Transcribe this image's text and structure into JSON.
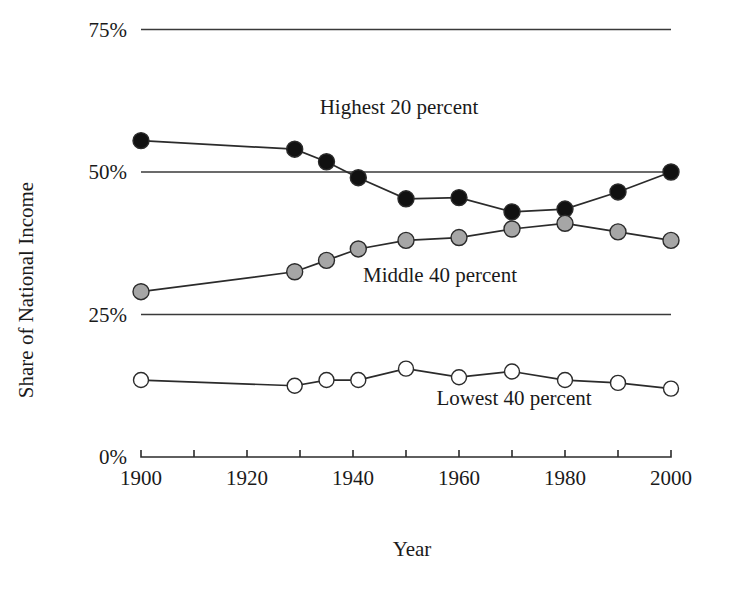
{
  "chart_data": {
    "type": "line",
    "title": "",
    "xlabel": "Year",
    "ylabel": "Share of National Income",
    "xlim": [
      1900,
      2000
    ],
    "ylim": [
      0,
      75
    ],
    "grid": true,
    "legend_position": "inline-annotations",
    "x_tick_labels": [
      "1900",
      "1920",
      "1940",
      "1960",
      "1980",
      "2000"
    ],
    "x_tick_values": [
      1900,
      1920,
      1940,
      1960,
      1980,
      2000
    ],
    "x_minor_tick_values": [
      1910,
      1930,
      1950,
      1970,
      1990
    ],
    "y_tick_labels": [
      "0%",
      "25%",
      "50%",
      "75%"
    ],
    "y_tick_values": [
      0,
      25,
      50,
      75
    ],
    "x": [
      1900,
      1929,
      1935,
      1941,
      1950,
      1960,
      1970,
      1980,
      1990,
      2000
    ],
    "series": [
      {
        "name": "Highest 20 percent",
        "marker": "filled-black-circle",
        "color": "#111111",
        "values": [
          55.5,
          54.0,
          51.8,
          49.0,
          45.3,
          45.5,
          43.0,
          43.5,
          46.5,
          50.0
        ]
      },
      {
        "name": "Middle 40 percent",
        "marker": "filled-gray-circle",
        "color": "#a6a6a6",
        "values": [
          29.0,
          32.5,
          34.5,
          36.5,
          38.0,
          38.5,
          40.0,
          41.0,
          39.5,
          38.0
        ]
      },
      {
        "name": "Lowest 40 percent",
        "marker": "open-white-circle",
        "color": "#ffffff",
        "values": [
          13.5,
          12.5,
          13.5,
          13.5,
          15.5,
          14.0,
          15.0,
          13.5,
          13.0,
          12.0
        ]
      }
    ],
    "annotations": [
      {
        "text": "Highest 20 percent",
        "x_px": 399,
        "y_px": 114
      },
      {
        "text": "Middle 40 percent",
        "x_px": 440,
        "y_px": 282
      },
      {
        "text": "Lowest 40 percent",
        "x_px": 514,
        "y_px": 405
      }
    ]
  }
}
